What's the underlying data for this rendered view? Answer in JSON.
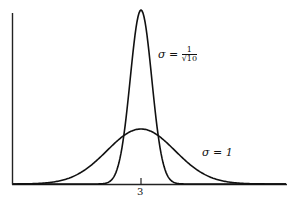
{
  "chart_data": {
    "type": "line",
    "title": "",
    "xlabel": "",
    "ylabel": "",
    "x_ticks": [
      {
        "value": 3,
        "label": "3"
      }
    ],
    "grid": false,
    "legend": "inline annotations",
    "mean": 3,
    "series": [
      {
        "name": "σ = 1/√10",
        "sigma": 0.3162,
        "mean": 3,
        "relative_peak": 3.162
      },
      {
        "name": "σ = 1",
        "sigma": 1,
        "mean": 3,
        "relative_peak": 1.0
      }
    ],
    "annotations": [
      {
        "text": "σ = 1/√10",
        "series": 0
      },
      {
        "text": "σ = 1",
        "series": 1
      }
    ]
  },
  "labels": {
    "narrow_sigma": "σ",
    "narrow_eq": " = ",
    "narrow_num": "1",
    "narrow_den": "√10",
    "wide": "σ = 1",
    "tick3": "3"
  }
}
